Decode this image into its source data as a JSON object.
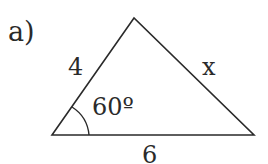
{
  "problem_label": "a)",
  "triangle": {
    "side_left": "4",
    "side_right": "x",
    "side_bottom": "6",
    "angle": "60º"
  },
  "colors": {
    "stroke": "#2a2a2a",
    "background": "#ffffff"
  }
}
